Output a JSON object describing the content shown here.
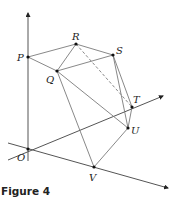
{
  "figure": {
    "caption": "Figure 4",
    "colors": {
      "line": "#7a7a7a",
      "axis": "#555555",
      "point": "#111111",
      "text": "#222222"
    },
    "points": [
      {
        "name": "P",
        "x": 28,
        "y": 57,
        "label_x": 17,
        "label_y": 61
      },
      {
        "name": "Q",
        "x": 57,
        "y": 71,
        "label_x": 46,
        "label_y": 83
      },
      {
        "name": "R",
        "x": 76,
        "y": 44,
        "label_x": 72,
        "label_y": 40
      },
      {
        "name": "S",
        "x": 113,
        "y": 55,
        "label_x": 116,
        "label_y": 54
      },
      {
        "name": "T",
        "x": 132,
        "y": 107,
        "label_x": 133,
        "label_y": 103
      },
      {
        "name": "U",
        "x": 128,
        "y": 128,
        "label_x": 131,
        "label_y": 134
      },
      {
        "name": "O",
        "x": 28,
        "y": 149,
        "label_x": 17,
        "label_y": 161
      },
      {
        "name": "V",
        "x": 94,
        "y": 167,
        "label_x": 89,
        "label_y": 181
      }
    ],
    "solid_edges": [
      [
        "P",
        "R"
      ],
      [
        "P",
        "Q"
      ],
      [
        "Q",
        "R"
      ],
      [
        "R",
        "S"
      ],
      [
        "Q",
        "S"
      ],
      [
        "S",
        "T"
      ],
      [
        "S",
        "U"
      ],
      [
        "T",
        "U"
      ],
      [
        "Q",
        "U"
      ],
      [
        "Q",
        "V"
      ],
      [
        "V",
        "U"
      ]
    ],
    "dashed_edges": [
      [
        "R",
        "T"
      ]
    ],
    "axes": [
      {
        "name": "vertical-axis",
        "x1": 28,
        "y1": 161,
        "x2": 28,
        "y2": 13
      },
      {
        "name": "axis-through-T",
        "x1": 8,
        "y1": 160,
        "x2": 163,
        "y2": 96
      },
      {
        "name": "axis-through-V",
        "x1": 8,
        "y1": 143,
        "x2": 168,
        "y2": 188
      }
    ]
  }
}
